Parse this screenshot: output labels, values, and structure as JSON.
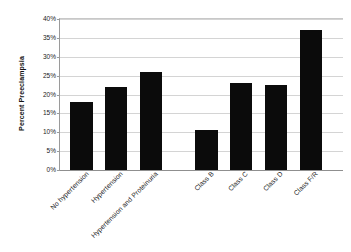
{
  "chart_data": {
    "type": "bar",
    "title": "",
    "xlabel": "",
    "ylabel": "Percent Preeclampsia",
    "categories": [
      "No hypertension",
      "Hypertension",
      "Hypertension and Proteinuria",
      "Class B",
      "Class C",
      "Class D",
      "Class F/R"
    ],
    "values": [
      18,
      22,
      26,
      10.5,
      23,
      22.5,
      37
    ],
    "value_labels": [
      "18%",
      "22%",
      "26%",
      "10.5%",
      "23%",
      "22.5%",
      "37%"
    ],
    "ylim": [
      0,
      40
    ],
    "ytick_labels": [
      "0%",
      "5%",
      "10%",
      "15%",
      "20%",
      "25%",
      "30%",
      "35%",
      "40%"
    ],
    "ytick_values": [
      0,
      5,
      10,
      15,
      20,
      25,
      30,
      35,
      40
    ],
    "grid": true,
    "legend": "none",
    "bar_color": "#0b0b0b",
    "gridline_color": "#d4d4d4",
    "axis_color": "#8f8f8f",
    "background_color": "#ffffff",
    "group_gap_after_index": 2
  }
}
